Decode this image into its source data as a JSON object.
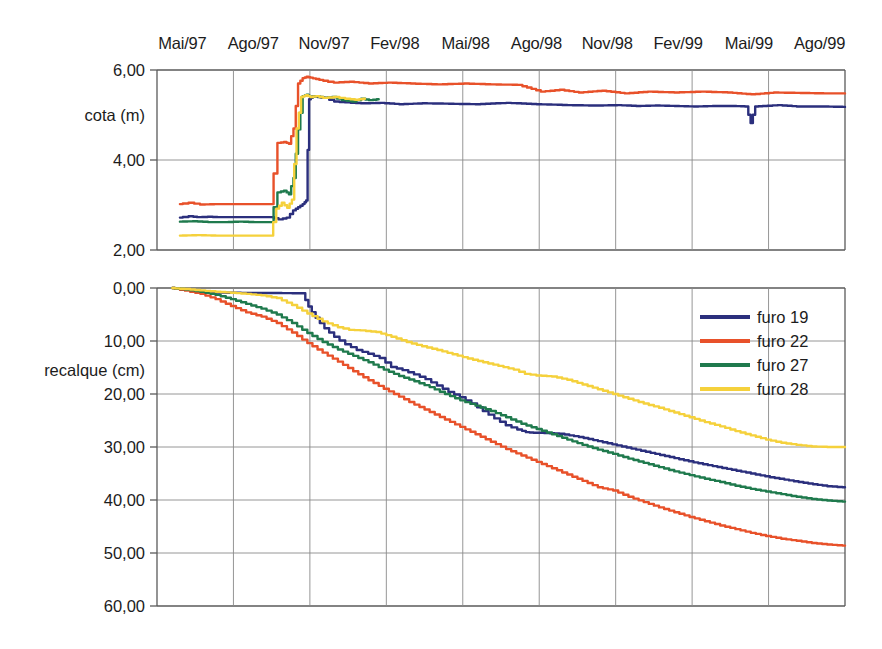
{
  "chart_data": {
    "type": "line",
    "title": "",
    "panels": [
      {
        "id": "cota",
        "ylabel": "cota (m)",
        "yticks": [
          "6,00",
          "4,00",
          "2,00"
        ],
        "ytick_values": [
          6.0,
          4.0,
          2.0
        ],
        "ylim": [
          2.0,
          6.0
        ],
        "y_inverted": false,
        "grid": true,
        "series": [
          {
            "name": "furo 19",
            "color": "#2b2f7d",
            "x": [
              0.3,
              0.45,
              0.55,
              0.7,
              0.82,
              0.95,
              1.05,
              1.2,
              1.35,
              1.5,
              1.62,
              1.72,
              1.8,
              1.86,
              1.92,
              1.96,
              2.0,
              2.05,
              2.12,
              2.22,
              2.35,
              2.5,
              2.7,
              2.95,
              3.2,
              3.5,
              3.85,
              4.2,
              4.6,
              5.0,
              5.4,
              5.75,
              6.05,
              6.3,
              6.55,
              6.8,
              7.05,
              7.3,
              7.55,
              7.72,
              7.78,
              7.84,
              7.95,
              8.15,
              8.4,
              8.7,
              9.0
            ],
            "y": [
              2.72,
              2.75,
              2.73,
              2.74,
              2.73,
              2.73,
              2.73,
              2.73,
              2.73,
              2.73,
              2.68,
              2.72,
              2.88,
              2.95,
              3.02,
              3.1,
              5.35,
              5.42,
              5.4,
              5.38,
              5.3,
              5.28,
              5.26,
              5.27,
              5.24,
              5.26,
              5.25,
              5.24,
              5.27,
              5.24,
              5.22,
              5.21,
              5.22,
              5.2,
              5.21,
              5.2,
              5.19,
              5.2,
              5.2,
              5.19,
              4.82,
              5.19,
              5.2,
              5.22,
              5.19,
              5.19,
              5.18
            ]
          },
          {
            "name": "furo 22",
            "color": "#e8512a",
            "x": [
              0.3,
              0.45,
              0.6,
              0.78,
              0.95,
              1.15,
              1.35,
              1.5,
              1.6,
              1.68,
              1.74,
              1.8,
              1.86,
              1.92,
              1.97,
              2.02,
              2.1,
              2.2,
              2.35,
              2.55,
              2.8,
              3.05,
              3.35,
              3.7,
              4.05,
              4.4,
              4.75,
              5.05,
              5.3,
              5.55,
              5.85,
              6.15,
              6.45,
              6.8,
              7.15,
              7.5,
              7.8,
              8.1,
              8.45,
              8.75,
              9.0
            ],
            "y": [
              3.02,
              3.05,
              3.01,
              3.02,
              3.02,
              3.02,
              3.02,
              3.02,
              4.38,
              4.4,
              4.36,
              4.7,
              5.7,
              5.82,
              5.85,
              5.83,
              5.8,
              5.76,
              5.72,
              5.74,
              5.7,
              5.72,
              5.7,
              5.68,
              5.7,
              5.68,
              5.67,
              5.52,
              5.56,
              5.5,
              5.54,
              5.48,
              5.52,
              5.5,
              5.52,
              5.5,
              5.46,
              5.5,
              5.49,
              5.48,
              5.48
            ]
          },
          {
            "name": "furo 27",
            "color": "#1f7a4d",
            "x": [
              0.3,
              0.5,
              0.7,
              0.9,
              1.1,
              1.3,
              1.5,
              1.6,
              1.68,
              1.74,
              1.8,
              1.86,
              1.92,
              1.97,
              2.02,
              2.1,
              2.2,
              2.32,
              2.45,
              2.58,
              2.7,
              2.8,
              2.9
            ],
            "y": [
              2.63,
              2.64,
              2.62,
              2.62,
              2.63,
              2.62,
              2.62,
              3.28,
              3.32,
              3.24,
              3.6,
              4.68,
              5.42,
              5.45,
              5.4,
              5.42,
              5.38,
              5.4,
              5.33,
              5.3,
              5.36,
              5.33,
              5.35
            ]
          },
          {
            "name": "furo 28",
            "color": "#f5d13c",
            "x": [
              0.3,
              0.55,
              0.8,
              1.05,
              1.3,
              1.5,
              1.58,
              1.65,
              1.72,
              1.78,
              1.84,
              1.9,
              1.96,
              2.02,
              2.1,
              2.2,
              2.35,
              2.5,
              2.62,
              2.72
            ],
            "y": [
              2.32,
              2.33,
              2.32,
              2.32,
              2.32,
              2.32,
              2.92,
              3.05,
              2.94,
              3.12,
              4.7,
              5.4,
              5.44,
              5.4,
              5.42,
              5.38,
              5.4,
              5.36,
              5.34,
              5.36
            ]
          }
        ]
      },
      {
        "id": "recalque",
        "ylabel": "recalque (cm)",
        "yticks": [
          "0,00",
          "10,00",
          "20,00",
          "30,00",
          "40,00",
          "50,00",
          "60,00"
        ],
        "ytick_values": [
          0.0,
          10.0,
          20.0,
          30.0,
          40.0,
          50.0,
          60.0
        ],
        "ylim": [
          0.0,
          60.0
        ],
        "y_inverted": true,
        "grid": true,
        "series": [
          {
            "name": "furo 19",
            "color": "#2b2f7d",
            "x": [
              0.2,
              0.4,
              0.6,
              0.8,
              1.0,
              1.2,
              1.4,
              1.6,
              1.8,
              1.92,
              2.0,
              2.1,
              2.22,
              2.35,
              2.5,
              2.65,
              2.8,
              2.95,
              3.1,
              3.25,
              3.4,
              3.55,
              3.7,
              3.85,
              4.0,
              4.15,
              4.3,
              4.45,
              4.6,
              4.75,
              4.85,
              4.95,
              5.1,
              5.3,
              5.55,
              5.8,
              6.05,
              6.3,
              6.55,
              6.8,
              7.05,
              7.3,
              7.55,
              7.8,
              8.05,
              8.3,
              8.55,
              8.8,
              9.0
            ],
            "y": [
              0.0,
              0.35,
              0.7,
              0.85,
              0.9,
              0.92,
              0.95,
              0.95,
              0.98,
              1.0,
              3.5,
              5.6,
              7.6,
              9.2,
              10.6,
              11.7,
              12.4,
              13.2,
              14.9,
              15.5,
              16.3,
              17.2,
              18.4,
              19.6,
              20.6,
              21.8,
              23.2,
              24.6,
              25.9,
              26.7,
              27.2,
              27.3,
              27.35,
              27.5,
              28.1,
              28.9,
              29.7,
              30.5,
              31.3,
              32.1,
              32.9,
              33.6,
              34.3,
              35.0,
              35.7,
              36.3,
              36.9,
              37.4,
              37.6
            ]
          },
          {
            "name": "furo 22",
            "color": "#e8512a",
            "x": [
              0.2,
              0.4,
              0.6,
              0.8,
              1.0,
              1.2,
              1.4,
              1.6,
              1.8,
              2.0,
              2.2,
              2.4,
              2.6,
              2.8,
              3.0,
              3.2,
              3.4,
              3.6,
              3.8,
              4.0,
              4.2,
              4.4,
              4.6,
              4.8,
              5.0,
              5.2,
              5.4,
              5.6,
              5.8,
              6.0,
              6.2,
              6.4,
              6.6,
              6.8,
              7.0,
              7.2,
              7.4,
              7.6,
              7.8,
              8.0,
              8.2,
              8.4,
              8.6,
              8.8,
              9.0
            ],
            "y": [
              0.0,
              0.5,
              1.1,
              2.1,
              3.4,
              4.6,
              5.4,
              6.6,
              8.4,
              10.4,
              12.2,
              13.9,
              15.7,
              17.4,
              19.0,
              20.5,
              22.0,
              23.4,
              24.8,
              26.2,
              27.6,
              29.0,
              30.4,
              31.6,
              32.8,
              34.0,
              35.2,
              36.4,
              37.6,
              38.2,
              39.4,
              40.4,
              41.4,
              42.3,
              43.2,
              44.0,
              44.8,
              45.5,
              46.2,
              46.8,
              47.3,
              47.7,
              48.1,
              48.4,
              48.6
            ]
          },
          {
            "name": "furo 27",
            "color": "#1f7a4d",
            "x": [
              0.2,
              0.4,
              0.6,
              0.8,
              1.0,
              1.2,
              1.4,
              1.6,
              1.8,
              2.0,
              2.2,
              2.4,
              2.6,
              2.8,
              3.0,
              3.2,
              3.4,
              3.6,
              3.8,
              4.0,
              4.2,
              4.4,
              4.6,
              4.8,
              5.0,
              5.2,
              5.4,
              5.6,
              5.8,
              6.0,
              6.2,
              6.4,
              6.6,
              6.8,
              7.0,
              7.2,
              7.4,
              7.6,
              7.8,
              8.0,
              8.2,
              8.4,
              8.6,
              8.8,
              9.0
            ],
            "y": [
              0.0,
              0.3,
              0.7,
              1.3,
              2.1,
              3.0,
              3.9,
              5.0,
              6.6,
              8.5,
              10.2,
              11.6,
              12.8,
              14.0,
              15.4,
              16.6,
              17.6,
              18.7,
              20.0,
              21.2,
              22.2,
              23.2,
              24.4,
              25.6,
              26.6,
              27.6,
              28.6,
              29.6,
              30.5,
              31.3,
              32.2,
              33.0,
              33.8,
              34.6,
              35.3,
              36.0,
              36.6,
              37.3,
              37.9,
              38.4,
              38.9,
              39.4,
              39.8,
              40.1,
              40.3
            ]
          },
          {
            "name": "furo 28",
            "color": "#f5d13c",
            "x": [
              0.2,
              0.4,
              0.6,
              0.8,
              1.0,
              1.2,
              1.4,
              1.6,
              1.8,
              2.0,
              2.2,
              2.4,
              2.55,
              2.7,
              2.9,
              3.1,
              3.3,
              3.5,
              3.7,
              3.9,
              4.1,
              4.3,
              4.5,
              4.7,
              4.85,
              5.0,
              5.2,
              5.4,
              5.6,
              5.8,
              6.0,
              6.2,
              6.4,
              6.6,
              6.8,
              7.0,
              7.2,
              7.4,
              7.6,
              7.8,
              8.0,
              8.2,
              8.4,
              8.6,
              8.8,
              9.0
            ],
            "y": [
              0.0,
              0.2,
              0.45,
              0.7,
              0.9,
              1.1,
              1.4,
              1.9,
              3.2,
              4.8,
              6.3,
              7.4,
              7.9,
              8.0,
              8.3,
              9.2,
              10.2,
              11.0,
              11.7,
              12.5,
              13.3,
              14.0,
              14.7,
              15.4,
              16.2,
              16.5,
              16.7,
              17.3,
              18.2,
              19.1,
              20.0,
              20.9,
              21.8,
              22.6,
              23.5,
              24.4,
              25.3,
              26.1,
              27.0,
              27.8,
              28.6,
              29.2,
              29.6,
              29.9,
              30.0,
              30.0
            ]
          }
        ]
      }
    ],
    "xlabel": "",
    "xticks": [
      "Mai/97",
      "Ago/97",
      "Nov/97",
      "Fev/98",
      "Mai/98",
      "Ago/98",
      "Nov/98",
      "Fev/99",
      "Mai/99",
      "Ago/99"
    ],
    "xtick_values": [
      0,
      1,
      2,
      3,
      4,
      5,
      6,
      7,
      8,
      9
    ],
    "xlim": [
      0,
      9
    ],
    "legend": {
      "position": "right-inside-lower-panel",
      "entries": [
        {
          "label": "furo 19",
          "color": "#2b2f7d"
        },
        {
          "label": "furo 22",
          "color": "#e8512a"
        },
        {
          "label": "furo 27",
          "color": "#1f7a4d"
        },
        {
          "label": "furo 28",
          "color": "#f5d13c"
        }
      ]
    },
    "colors": {
      "furo_19": "#2b2f7d",
      "furo_22": "#e8512a",
      "furo_27": "#1f7a4d",
      "furo_28": "#f5d13c",
      "grid": "#8a8a8a",
      "axis": "#5a5a5a",
      "background": "#ffffff"
    }
  }
}
